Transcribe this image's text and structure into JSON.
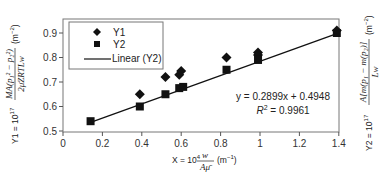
{
  "chart_data": {
    "type": "scatter",
    "title": "",
    "xlabel": "X = 10^4 w/(Aμ̄) (m^-1)",
    "ylabel": "Y1 = 10^17 MA(p1^2 - p2^2)/(2μ̄ZRTLw) (m^-2)",
    "ylabel_right": "Y2 = 10^17 A[m(p1) - m(p2)]/(Lw) (m^-2)",
    "xlim": [
      0,
      1.4
    ],
    "ylim": [
      0.5,
      0.95
    ],
    "x_ticks": [
      0,
      0.2,
      0.4,
      0.6,
      0.8,
      1,
      1.2,
      1.4
    ],
    "x_tick_labels": [
      "0",
      "0.2",
      "0.4",
      "0.6",
      "0.8",
      "1",
      "1.2",
      "1.4"
    ],
    "y_ticks": [
      0.5,
      0.6,
      0.7,
      0.8,
      0.9
    ],
    "y_tick_labels": [
      "0.5",
      "0.6",
      "0.7",
      "0.8",
      "0.9"
    ],
    "grid": false,
    "legend_position": "upper left",
    "series": [
      {
        "name": "Y1",
        "marker": "diamond",
        "x": [
          0.39,
          0.52,
          0.59,
          0.6,
          0.83,
          0.99,
          0.99,
          1.39
        ],
        "y": [
          0.65,
          0.72,
          0.73,
          0.745,
          0.8,
          0.81,
          0.82,
          0.91
        ]
      },
      {
        "name": "Y2",
        "marker": "square",
        "x": [
          0.14,
          0.39,
          0.52,
          0.59,
          0.61,
          0.83,
          0.99,
          1.39
        ],
        "y": [
          0.54,
          0.6,
          0.65,
          0.675,
          0.68,
          0.75,
          0.79,
          0.9
        ]
      },
      {
        "name": "Linear (Y2)",
        "type": "line",
        "slope": 0.2899,
        "intercept": 0.4948,
        "x_range": [
          0.14,
          1.39
        ]
      }
    ],
    "annotations": [
      "y = 0.2899x + 0.4948",
      "R^2 = 0.9961"
    ]
  },
  "legend": {
    "items": [
      {
        "label": "Y1",
        "marker": "diamond"
      },
      {
        "label": "Y2",
        "marker": "square"
      },
      {
        "label": "Linear (Y2)",
        "marker": "line"
      }
    ]
  },
  "equation": {
    "line1": "y = 0.2899x + 0.4948",
    "r2_prefix": "R",
    "r2_sup": "2",
    "r2_value": " = 0.9961"
  },
  "axes": {
    "x_label": {
      "lhs": "X = 10",
      "exp": "4",
      "num": "w",
      "den": "Aμ̄",
      "unit": "(m",
      "unit_exp": "−1",
      "unit_close": ")"
    },
    "y1_label": {
      "lhs": "Y1 = 10",
      "exp": "17",
      "num": "MA(p₁² − p₂²)",
      "den": "2μ̄ZRTLw",
      "unit": "(m",
      "unit_exp": "−2",
      "unit_close": ")"
    },
    "y2_label": {
      "lhs": "Y2 = 10",
      "exp": "17",
      "num": "A[m(p₁ − m(p₂)]",
      "den": "Lw",
      "unit": "(m",
      "unit_exp": "−2",
      "unit_close": ")"
    }
  },
  "colors": {
    "marker": "#111111",
    "line": "#111111",
    "axis": "#555555",
    "frame": "#777777"
  }
}
